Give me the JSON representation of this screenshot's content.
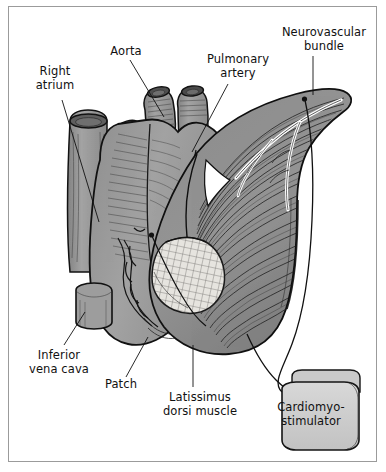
{
  "figure": {
    "type": "anatomical-illustration",
    "background_color": "#ffffff",
    "border_color": "#9b9b9b",
    "ink_color": "#111111",
    "heart_fill": "#9a9a9a",
    "muscle_fill": "#8f8f8f",
    "patch_fill": "#e3e1dc",
    "device_fill": "#cfcfcf",
    "lumen_fill": "#5e5e5e"
  },
  "labels": [
    {
      "id": "right-atrium",
      "text": "Right\natrium",
      "x": 22,
      "y": 64,
      "width": 66,
      "align": "center",
      "leader": {
        "x1": 62,
        "y1": 100,
        "x2": 99,
        "y2": 222
      }
    },
    {
      "id": "aorta",
      "text": "Aorta",
      "x": 97,
      "y": 44,
      "width": 58,
      "align": "center",
      "leader": {
        "x1": 130,
        "y1": 60,
        "x2": 164,
        "y2": 117
      }
    },
    {
      "id": "pulmonary-artery",
      "text": "Pulmonary\nartery",
      "x": 200,
      "y": 52,
      "width": 76,
      "align": "center",
      "leader": {
        "x1": 228,
        "y1": 84,
        "x2": 192,
        "y2": 152
      }
    },
    {
      "id": "neurovascular-bundle",
      "text": "Neurovascular\nbundle",
      "x": 272,
      "y": 25,
      "width": 104,
      "align": "center",
      "leader": {
        "x1": 313,
        "y1": 56,
        "x2": 313,
        "y2": 95
      }
    },
    {
      "id": "inferior-vena-cava",
      "text": "Inferior\nvena cava",
      "x": 22,
      "y": 348,
      "width": 74,
      "align": "center",
      "leader": {
        "x1": 64,
        "y1": 345,
        "x2": 85,
        "y2": 312
      }
    },
    {
      "id": "patch",
      "text": "Patch",
      "x": 98,
      "y": 377,
      "width": 46,
      "align": "center",
      "leader": {
        "x1": 126,
        "y1": 377,
        "x2": 148,
        "y2": 337
      }
    },
    {
      "id": "latissimus-dorsi-muscle",
      "text": "Latissimus\ndorsi muscle",
      "x": 158,
      "y": 390,
      "width": 84,
      "align": "center",
      "leader": {
        "x1": 193,
        "y1": 387,
        "x2": 193,
        "y2": 345
      }
    }
  ],
  "device": {
    "id": "cardiomyostimulator",
    "text": "Cardiomyo-\nstimulator",
    "x": 268,
    "y": 400,
    "width": 86,
    "align": "center",
    "body": {
      "x": 266,
      "y": 388,
      "width": 94,
      "height": 62
    },
    "header": {
      "x": 284,
      "y": 377,
      "width": 76,
      "height": 16
    }
  },
  "leads": {
    "count": 2,
    "description": "Two pacing leads running from the muscle-wrapped heart to the cardiomyostimulator"
  },
  "anatomy_parts": [
    {
      "id": "superior-vena-cava-stump",
      "label": "Right atrium / SVC stump"
    },
    {
      "id": "aortic-stump",
      "label": "Aorta"
    },
    {
      "id": "pulmonary-artery-stump",
      "label": "Pulmonary artery"
    },
    {
      "id": "heart-body",
      "label": "Heart"
    },
    {
      "id": "inferior-vena-cava-stump",
      "label": "Inferior vena cava"
    },
    {
      "id": "coronary-vessels",
      "label": "Coronary vessels"
    },
    {
      "id": "muscle-wrap",
      "label": "Latissimus dorsi muscle wrap"
    },
    {
      "id": "neurovascular-pedicle",
      "label": "Neurovascular bundle"
    },
    {
      "id": "mesh-patch",
      "label": "Patch"
    }
  ]
}
